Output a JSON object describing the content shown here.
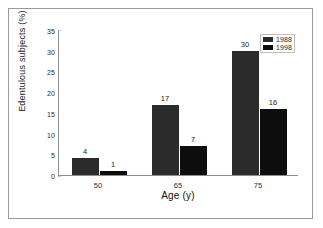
{
  "figure": {
    "frame_color": "#9a9a9a",
    "background": "#ffffff"
  },
  "chart_data": {
    "type": "bar",
    "title": "",
    "subtitle": "",
    "xlabel": "Age (y)",
    "ylabel": "Edentulous subjects (%)",
    "categories": [
      "50",
      "65",
      "75"
    ],
    "ylim": [
      0,
      35
    ],
    "yticks": [
      "0",
      "5",
      "10",
      "15",
      "20",
      "25",
      "30",
      "35"
    ],
    "grid": false,
    "legend_position": "top-right",
    "series": [
      {
        "name": "1988",
        "color": "#2b2b2b",
        "values": [
          4,
          17,
          30
        ],
        "labels": [
          "4",
          "17",
          "30"
        ]
      },
      {
        "name": "1998",
        "color": "#0d0d0d",
        "values": [
          1,
          7,
          16
        ],
        "labels": [
          "1",
          "7",
          "16"
        ]
      }
    ]
  }
}
